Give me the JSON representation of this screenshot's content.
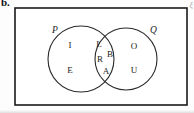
{
  "figure": {
    "label": "b.",
    "universal_set_symbol": "ξ"
  },
  "diagram": {
    "type": "venn-two-set",
    "universe": {
      "name": "universal-set",
      "shape": "rectangle"
    },
    "sets": [
      {
        "id": "P",
        "label": "P",
        "label_x": 52,
        "label_y": 33,
        "cx": 81,
        "cy": 59,
        "r": 33
      },
      {
        "id": "Q",
        "label": "Q",
        "label_x": 150,
        "label_y": 33,
        "cx": 126,
        "cy": 59,
        "r": 31
      }
    ],
    "regions": {
      "p_only": {
        "name": "P only",
        "elements": [
          {
            "text": "I",
            "x": 70,
            "y": 46
          },
          {
            "text": "E",
            "x": 70,
            "y": 71
          }
        ]
      },
      "intersection": {
        "name": "P intersect Q",
        "elements": [
          {
            "text": "L",
            "x": 99,
            "y": 45
          },
          {
            "text": "B",
            "x": 110,
            "y": 55
          },
          {
            "text": "R",
            "x": 100,
            "y": 60
          },
          {
            "text": "A",
            "x": 106,
            "y": 72
          }
        ]
      },
      "q_only": {
        "name": "Q only",
        "elements": [
          {
            "text": "O",
            "x": 134,
            "y": 47
          },
          {
            "text": "U",
            "x": 134,
            "y": 71
          }
        ]
      }
    },
    "geometry": {
      "rect_x": 15,
      "rect_y": 8,
      "rect_w": 172,
      "rect_h": 97
    },
    "colors": {
      "stroke": "#1a1a1a",
      "circle_stroke": "#2a2a2a",
      "background": "#ffffff"
    }
  }
}
